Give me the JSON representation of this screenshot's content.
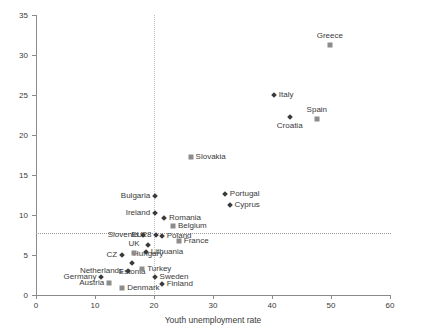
{
  "chart_data": {
    "type": "scatter",
    "title": "",
    "xlabel": "Youth unemployment rate",
    "ylabel": "Youth long-term unemployment rate",
    "xlim": [
      0,
      60
    ],
    "ylim": [
      0,
      35
    ],
    "xticks": [
      0,
      10,
      20,
      30,
      40,
      50,
      60
    ],
    "yticks": [
      0,
      5,
      10,
      15,
      20,
      25,
      30,
      35
    ],
    "grid": false,
    "legend": "none",
    "reference_lines": [
      {
        "axis": "y",
        "value": 7.7,
        "style": "dotted"
      },
      {
        "axis": "x",
        "value": 20.0,
        "style": "dotted"
      }
    ],
    "points": [
      {
        "label": "Greece",
        "x": 49.8,
        "y": 31.2,
        "marker": "square",
        "label_pos": "top"
      },
      {
        "label": "Spain",
        "x": 47.6,
        "y": 22.0,
        "marker": "square",
        "label_pos": "top"
      },
      {
        "label": "Italy",
        "x": 40.3,
        "y": 25.0,
        "marker": "diamond",
        "label_pos": "right"
      },
      {
        "label": "Croatia",
        "x": 43.0,
        "y": 22.2,
        "marker": "diamond",
        "label_pos": "bottom"
      },
      {
        "label": "Slovakia",
        "x": 26.2,
        "y": 17.2,
        "marker": "square",
        "label_pos": "right"
      },
      {
        "label": "Portugal",
        "x": 32.0,
        "y": 12.6,
        "marker": "diamond",
        "label_pos": "right"
      },
      {
        "label": "Cyprus",
        "x": 32.8,
        "y": 11.2,
        "marker": "diamond",
        "label_pos": "right"
      },
      {
        "label": "Bulgaria",
        "x": 20.2,
        "y": 12.4,
        "marker": "diamond",
        "label_pos": "left"
      },
      {
        "label": "Ireland",
        "x": 20.2,
        "y": 10.2,
        "marker": "diamond",
        "label_pos": "left"
      },
      {
        "label": "Romania",
        "x": 21.7,
        "y": 9.6,
        "marker": "diamond",
        "label_pos": "right"
      },
      {
        "label": "Belgium",
        "x": 23.2,
        "y": 8.6,
        "marker": "square",
        "label_pos": "right"
      },
      {
        "label": "Poland",
        "x": 21.3,
        "y": 7.4,
        "marker": "diamond",
        "label_pos": "right"
      },
      {
        "label": "France",
        "x": 24.2,
        "y": 6.8,
        "marker": "square",
        "label_pos": "right"
      },
      {
        "label": "EU28",
        "x": 20.4,
        "y": 7.5,
        "marker": "diamond",
        "label_pos": "left"
      },
      {
        "label": "Slovenia",
        "x": 18.2,
        "y": 7.5,
        "marker": "diamond",
        "label_pos": "left"
      },
      {
        "label": "Hungary",
        "x": 19.0,
        "y": 6.3,
        "marker": "diamond",
        "label_pos": "bottom"
      },
      {
        "label": "Lithuania",
        "x": 18.6,
        "y": 5.4,
        "marker": "diamond",
        "label_pos": "right"
      },
      {
        "label": "UK",
        "x": 16.6,
        "y": 5.2,
        "marker": "square",
        "label_pos": "top"
      },
      {
        "label": "CZ",
        "x": 14.6,
        "y": 5.0,
        "marker": "diamond",
        "label_pos": "left"
      },
      {
        "label": "Estonia",
        "x": 16.3,
        "y": 4.0,
        "marker": "diamond",
        "label_pos": "bottom"
      },
      {
        "label": "Netherlands",
        "x": 15.6,
        "y": 3.0,
        "marker": "diamond",
        "label_pos": "left"
      },
      {
        "label": "Turkey",
        "x": 18.0,
        "y": 3.2,
        "marker": "square",
        "label_pos": "right"
      },
      {
        "label": "Germany",
        "x": 11.1,
        "y": 2.3,
        "marker": "diamond",
        "label_pos": "left"
      },
      {
        "label": "Austria",
        "x": 12.4,
        "y": 1.5,
        "marker": "square",
        "label_pos": "left"
      },
      {
        "label": "Denmark",
        "x": 14.6,
        "y": 0.9,
        "marker": "square",
        "label_pos": "right"
      },
      {
        "label": "Sweden",
        "x": 20.1,
        "y": 2.2,
        "marker": "diamond",
        "label_pos": "right"
      },
      {
        "label": "Finland",
        "x": 21.3,
        "y": 1.4,
        "marker": "diamond",
        "label_pos": "right"
      }
    ]
  }
}
